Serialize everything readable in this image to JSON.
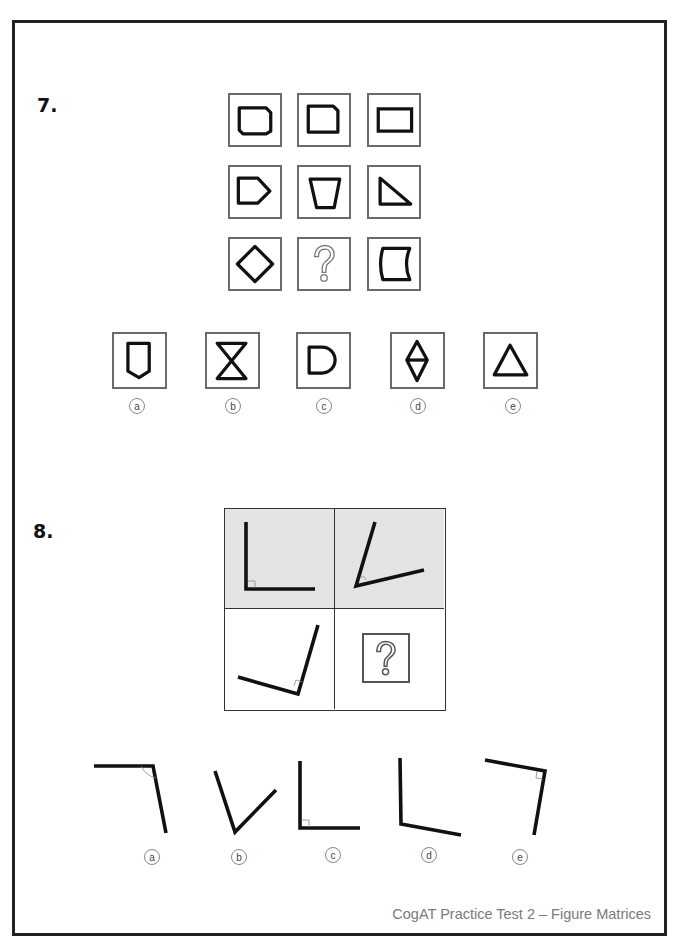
{
  "questions": [
    {
      "number": "7.",
      "type": "figure-matrix-3x3",
      "matrix": [
        [
          "rectangle-cut-corners-tr-bl",
          "rectangle-cut-corner-tr",
          "rectangle"
        ],
        [
          "pentagon-arrow-right",
          "trapezoid-inverted",
          "right-triangle"
        ],
        [
          "diamond",
          "question-mark",
          "concave-right-rectangle"
        ]
      ],
      "options": [
        {
          "letter": "a",
          "shape": "shield-pentagon"
        },
        {
          "letter": "b",
          "shape": "hourglass"
        },
        {
          "letter": "c",
          "shape": "d-shape"
        },
        {
          "letter": "d",
          "shape": "double-triangle-diamond"
        },
        {
          "letter": "e",
          "shape": "triangle"
        }
      ]
    },
    {
      "number": "8.",
      "type": "figure-matrix-2x2",
      "matrix": [
        [
          "right-angle-L",
          "acute-angle-rotated"
        ],
        [
          "right-angle-rotated",
          "question-mark"
        ]
      ],
      "options": [
        {
          "letter": "a",
          "shape": "obtuse-angle-top-right"
        },
        {
          "letter": "b",
          "shape": "acute-v-angle"
        },
        {
          "letter": "c",
          "shape": "right-angle-L"
        },
        {
          "letter": "d",
          "shape": "obtuse-L"
        },
        {
          "letter": "e",
          "shape": "right-angle-rotated-top-right"
        }
      ]
    }
  ],
  "footer": {
    "text": "CogAT Practice Test 2 – Figure Matrices"
  },
  "colors": {
    "stroke": "#111111",
    "cell_border": "#6a6a6a",
    "shaded_bg": "#e4e4e4",
    "footer_text": "#7a7a7a"
  }
}
